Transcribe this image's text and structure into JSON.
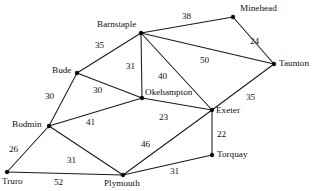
{
  "figure": {
    "type": "weighted-undirected-graph",
    "width": 314,
    "height": 191,
    "background_color": "#ffffff",
    "line_color": "#1a1a1a",
    "text_color": "#111111"
  },
  "chart_data": {
    "type": "diagram",
    "title": "",
    "nodes": [
      {
        "id": "minehead",
        "label": "Minehead",
        "x": 233,
        "y": 17,
        "label_x": 240,
        "label_y": 4,
        "anchor": "left"
      },
      {
        "id": "barnstaple",
        "label": "Barnstaple",
        "x": 141,
        "y": 33,
        "label_x": 97,
        "label_y": 20,
        "anchor": "left"
      },
      {
        "id": "taunton",
        "label": "Taunton",
        "x": 274,
        "y": 64,
        "label_x": 279,
        "label_y": 59,
        "anchor": "left"
      },
      {
        "id": "bude",
        "label": "Bude",
        "x": 77,
        "y": 73,
        "label_x": 52,
        "label_y": 66,
        "anchor": "left"
      },
      {
        "id": "okehampton",
        "label": "Okehampton",
        "x": 142,
        "y": 98,
        "label_x": 145,
        "label_y": 88,
        "anchor": "left"
      },
      {
        "id": "exeter",
        "label": "Exeter",
        "x": 212,
        "y": 110,
        "label_x": 216,
        "label_y": 106,
        "anchor": "left"
      },
      {
        "id": "bodmin",
        "label": "Bodmin",
        "x": 49,
        "y": 126,
        "label_x": 12,
        "label_y": 120,
        "anchor": "left"
      },
      {
        "id": "torquay",
        "label": "Torquay",
        "x": 212,
        "y": 155,
        "label_x": 217,
        "label_y": 150,
        "anchor": "left"
      },
      {
        "id": "truro",
        "label": "Truro",
        "x": 7,
        "y": 172,
        "label_x": 2,
        "label_y": 177,
        "anchor": "left"
      },
      {
        "id": "plymouth",
        "label": "Plymouth",
        "x": 123,
        "y": 175,
        "label_x": 104,
        "label_y": 179,
        "anchor": "left"
      }
    ],
    "edges": [
      {
        "from": "barnstaple",
        "to": "minehead",
        "weight": 38,
        "label_x": 182,
        "label_y": 12
      },
      {
        "from": "minehead",
        "to": "taunton",
        "weight": 24,
        "label_x": 250,
        "label_y": 37
      },
      {
        "from": "barnstaple",
        "to": "taunton",
        "weight": 50,
        "label_x": 200,
        "label_y": 56
      },
      {
        "from": "barnstaple",
        "to": "bude",
        "weight": 35,
        "label_x": 95,
        "label_y": 41
      },
      {
        "from": "barnstaple",
        "to": "okehampton",
        "weight": 31,
        "label_x": 126,
        "label_y": 62
      },
      {
        "from": "barnstaple",
        "to": "exeter",
        "weight": 40,
        "label_x": 158,
        "label_y": 72
      },
      {
        "from": "bude",
        "to": "okehampton",
        "weight": 30,
        "label_x": 93,
        "label_y": 86
      },
      {
        "from": "bude",
        "to": "bodmin",
        "weight": 30,
        "label_x": 45,
        "label_y": 92
      },
      {
        "from": "bodmin",
        "to": "okehampton",
        "weight": 41,
        "label_x": 86,
        "label_y": 118
      },
      {
        "from": "okehampton",
        "to": "exeter",
        "weight": 23,
        "label_x": 159,
        "label_y": 113
      },
      {
        "from": "exeter",
        "to": "taunton",
        "weight": 35,
        "label_x": 246,
        "label_y": 93
      },
      {
        "from": "exeter",
        "to": "torquay",
        "weight": 22,
        "label_x": 217,
        "label_y": 130
      },
      {
        "from": "exeter",
        "to": "plymouth",
        "weight": 46,
        "label_x": 141,
        "label_y": 140
      },
      {
        "from": "bodmin",
        "to": "truro",
        "weight": 26,
        "label_x": 9,
        "label_y": 145
      },
      {
        "from": "bodmin",
        "to": "plymouth",
        "weight": 31,
        "label_x": 67,
        "label_y": 156
      },
      {
        "from": "truro",
        "to": "plymouth",
        "weight": 52,
        "label_x": 54,
        "label_y": 178
      },
      {
        "from": "plymouth",
        "to": "torquay",
        "weight": 31,
        "label_x": 170,
        "label_y": 167
      }
    ]
  }
}
